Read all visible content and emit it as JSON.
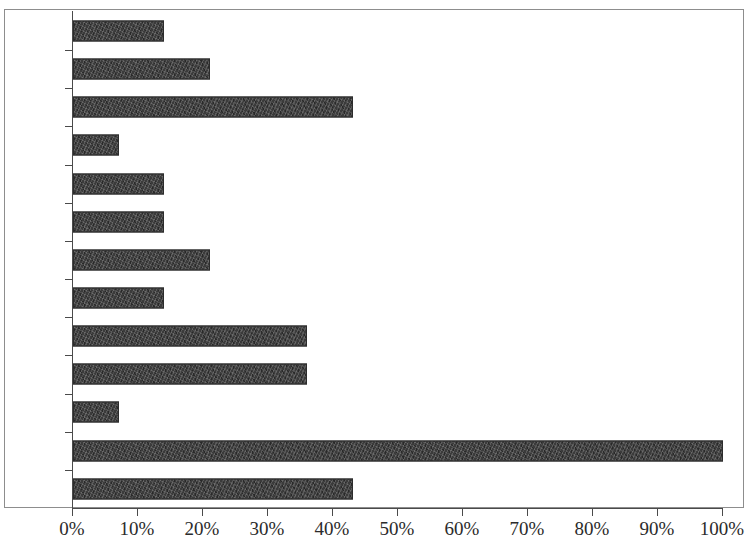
{
  "chart_data": {
    "type": "bar",
    "orientation": "horizontal",
    "title": "",
    "subtitle": "",
    "xlabel": "",
    "ylabel": "",
    "xlim": [
      0,
      100
    ],
    "xtick_labels": [
      "0%",
      "10%",
      "20%",
      "30%",
      "40%",
      "50%",
      "60%",
      "70%",
      "80%",
      "90%",
      "100%"
    ],
    "xtick_values": [
      0,
      10,
      20,
      30,
      40,
      50,
      60,
      70,
      80,
      90,
      100
    ],
    "grid": false,
    "legend": null,
    "categories": [
      "跖骨",
      "跟骨",
      "胫骨",
      "股骨",
      "盆骨",
      "掌骨",
      "桡骨",
      "尺骨",
      "肱骨",
      "肩胛骨",
      "寰椎",
      "下颌",
      "上腭"
    ],
    "values": [
      14,
      21,
      43,
      7,
      14,
      14,
      21,
      14,
      36,
      36,
      7,
      100,
      43
    ],
    "series": [
      {
        "name": "",
        "values": [
          14,
          21,
          43,
          7,
          14,
          14,
          21,
          14,
          36,
          36,
          7,
          100,
          43
        ]
      }
    ],
    "bar_color": "#3b3b3b",
    "axis_color": "#4a4a4a",
    "background_color": "#ffffff"
  }
}
